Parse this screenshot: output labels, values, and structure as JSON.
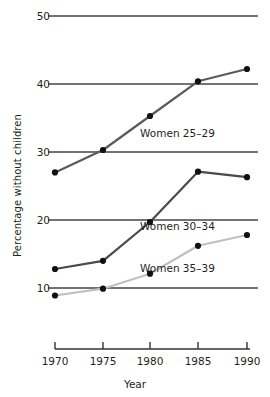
{
  "chart_data": {
    "type": "line",
    "title": "",
    "xlabel": "Year",
    "ylabel": "Percentage without children",
    "x": [
      1970,
      1975,
      1980,
      1985,
      1990
    ],
    "xtick_labels": [
      "1970",
      "1975",
      "1980",
      "1985",
      "1990"
    ],
    "ytick_labels": [
      "10",
      "20",
      "30",
      "40",
      "50"
    ],
    "yticks": [
      10,
      20,
      30,
      40,
      50
    ],
    "ylim": [
      5,
      50
    ],
    "xlim": [
      1968,
      1992
    ],
    "grid": "horizontal",
    "legend_position": "inline-annotations",
    "series": [
      {
        "name": "Women 25–29",
        "label": "Women 25–29",
        "color": "#5a5a5a",
        "marker_color": "#111111",
        "values": [
          27.0,
          30.3,
          35.3,
          40.4,
          42.2
        ]
      },
      {
        "name": "Women 30–34",
        "label": "Women 30–34",
        "color": "#4a4a4a",
        "marker_color": "#111111",
        "values": [
          12.8,
          14.0,
          19.7,
          27.1,
          26.3
        ]
      },
      {
        "name": "Women 35–39",
        "label": "Women 35–39",
        "color": "#c0c0c0",
        "marker_color": "#111111",
        "values": [
          8.9,
          9.9,
          12.1,
          16.2,
          17.8
        ]
      }
    ],
    "annotations": [
      {
        "text": "Women 25–29",
        "x": 1980.2,
        "y": 32.0
      },
      {
        "text": "Women 30–34",
        "x": 1980.2,
        "y": 18.4
      },
      {
        "text": "Women 35–39",
        "x": 1980.2,
        "y": 11.4
      }
    ],
    "axis_color": "#333333",
    "grid_color": "#555555",
    "background": "#ffffff"
  }
}
